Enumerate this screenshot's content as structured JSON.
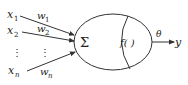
{
  "diagram": {
    "type": "neuron-model",
    "inputs": [
      {
        "label": "x",
        "sub": "1",
        "weight": "w",
        "weight_sub": "1"
      },
      {
        "label": "x",
        "sub": "2",
        "weight": "w",
        "weight_sub": "2"
      },
      {
        "label": "x",
        "sub": "n",
        "weight": "w",
        "weight_sub": "n"
      }
    ],
    "ellipsis": "⋮",
    "summation_symbol": "Σ",
    "activation_label": "f(   )",
    "threshold_label": "θ",
    "output_label": "y",
    "colors": {
      "stroke": "#333333",
      "text": "#222222",
      "background": "#ffffff"
    }
  }
}
